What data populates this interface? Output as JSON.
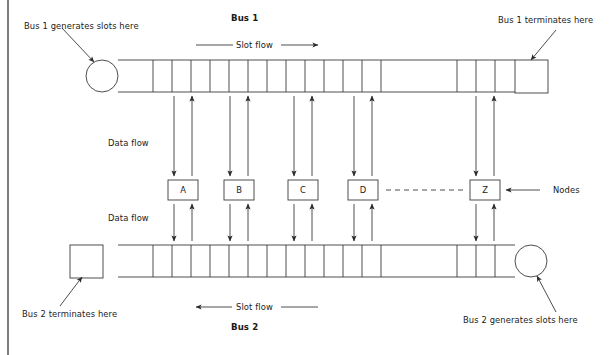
{
  "figure": {
    "type": "network-topology-diagram",
    "background": "#ffffff",
    "stroke": "#3a3a3a",
    "text_color": "#1a1a1a",
    "frame_line_x": 8
  },
  "labels": {
    "bus1_title": "Bus 1",
    "bus2_title": "Bus 2",
    "bus1_generator": "Bus 1 generates slots here",
    "bus1_terminator": "Bus 1 terminates here",
    "bus2_generator": "Bus 2 generates slots here",
    "bus2_terminator": "Bus 2 terminates here",
    "slot_flow_top": "Slot flow",
    "slot_flow_bottom": "Slot flow",
    "data_flow_upper": "Data flow",
    "data_flow_lower": "Data flow",
    "nodes_caption": "Nodes"
  },
  "nodes": [
    {
      "label": "A",
      "x": 168,
      "w": 30
    },
    {
      "label": "B",
      "x": 224,
      "w": 30
    },
    {
      "label": "C",
      "x": 288,
      "w": 30
    },
    {
      "label": "D",
      "x": 348,
      "w": 30
    },
    {
      "label": "Z",
      "x": 470,
      "w": 30
    }
  ],
  "buses": {
    "bus1": {
      "name": "Bus 1",
      "direction": "left-to-right",
      "y_top": 60,
      "y_bottom": 92,
      "x_start": 118,
      "x_end": 515,
      "endpoint_left": "circle-generator",
      "endpoint_right": "square-terminator",
      "slot_dividers": [
        153,
        172,
        191,
        210,
        229,
        248,
        267,
        286,
        305,
        324,
        343,
        362,
        381,
        457,
        476,
        495
      ]
    },
    "bus2": {
      "name": "Bus 2",
      "direction": "right-to-left",
      "y_top": 245,
      "y_bottom": 277,
      "x_start": 118,
      "x_end": 515,
      "endpoint_left": "square-terminator",
      "endpoint_right": "circle-generator",
      "slot_dividers": [
        153,
        172,
        191,
        210,
        229,
        248,
        267,
        286,
        305,
        324,
        343,
        362,
        381,
        457,
        476,
        495
      ]
    }
  },
  "endpoints": {
    "bus1_circle": {
      "cx": 102,
      "cy": 76,
      "r": 16
    },
    "bus1_square": {
      "x": 515,
      "y": 60,
      "w": 33,
      "h": 33
    },
    "bus2_square": {
      "x": 70,
      "y": 245,
      "w": 33,
      "h": 33
    },
    "bus2_circle": {
      "cx": 531,
      "cy": 261,
      "r": 16
    }
  },
  "ellipsis": {
    "x1": 385,
    "x2": 462,
    "y": 190,
    "style": "dashed"
  }
}
